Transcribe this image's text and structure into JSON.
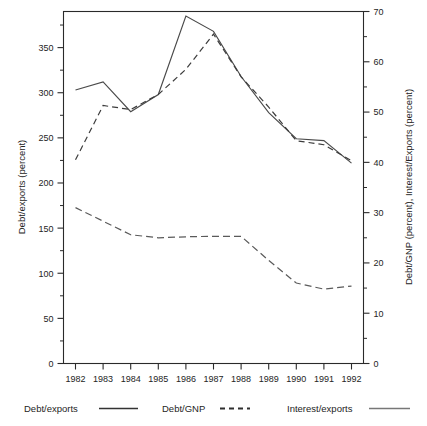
{
  "chart_data": {
    "type": "line",
    "title": "",
    "subtitle": "",
    "xlabel": "",
    "ylabel": "Debt/exports (percent)",
    "y2label": "Debt/GNP (percent), Interest/Exports (percent)",
    "categories": [
      "1982",
      "1983",
      "1984",
      "1985",
      "1986",
      "1987",
      "1988",
      "1989",
      "1990",
      "1991",
      "1992"
    ],
    "x": [
      1982,
      1983,
      1984,
      1985,
      1986,
      1987,
      1988,
      1989,
      1990,
      1991,
      1992
    ],
    "ylim": [
      0,
      390
    ],
    "y2lim": [
      0,
      70
    ],
    "yticks": [
      0,
      50,
      100,
      150,
      200,
      250,
      300,
      350
    ],
    "yticklabels": [
      "0",
      "50",
      "100",
      "150",
      "200",
      "250",
      "300",
      "350"
    ],
    "yminorticks": [
      25,
      75,
      125,
      175,
      225,
      275,
      325,
      375
    ],
    "y2ticks": [
      0,
      10,
      20,
      30,
      40,
      50,
      60,
      70
    ],
    "y2ticklabels": [
      "0",
      "10",
      "20",
      "30",
      "40",
      "50",
      "60",
      "70"
    ],
    "y2minorticks": [
      5,
      15,
      25,
      35,
      45,
      55,
      65
    ],
    "grid": false,
    "legend_position": "bottom",
    "series": [
      {
        "name": "Debt/exports",
        "axis": "left",
        "style": "solid",
        "color": "#4a4a4a",
        "unit": "percent",
        "values": [
          303,
          312,
          279,
          298,
          385,
          368,
          318,
          278,
          249,
          247,
          222
        ]
      },
      {
        "name": "Debt/GNP",
        "axis": "right",
        "style": "dashed",
        "color": "#3c3c3c",
        "unit": "percent",
        "values": [
          40.5,
          51.3,
          50.5,
          53.5,
          58.5,
          65.5,
          57.0,
          51.0,
          44.3,
          43.5,
          40.3
        ]
      },
      {
        "name": "Interest/exports",
        "axis": "right",
        "style": "dashed-long",
        "color": "#5a5a5a",
        "unit": "percent",
        "values": [
          31.0,
          28.3,
          25.6,
          25.0,
          25.2,
          25.3,
          25.3,
          20.5,
          16.0,
          14.8,
          15.4
        ]
      }
    ]
  },
  "legend": {
    "items": [
      {
        "label": "Debt/exports",
        "swatch": "solid-dark-line"
      },
      {
        "label": "Debt/GNP",
        "swatch": "dashed-line"
      },
      {
        "label": "Interest/exports",
        "swatch": "solid-gray-line"
      }
    ]
  },
  "axes": {
    "left_title": "Debt/exports (percent)",
    "right_title": "Debt/GNP (percent), Interest/Exports (percent)"
  }
}
